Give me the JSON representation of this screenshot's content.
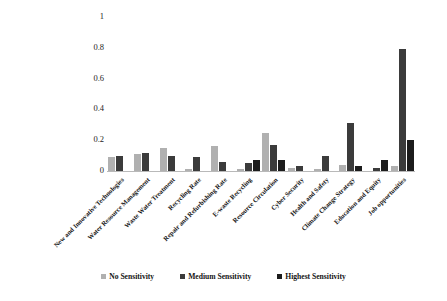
{
  "chart_data": {
    "type": "bar",
    "title": "",
    "xlabel": "",
    "ylabel": "",
    "ylim": [
      0,
      1
    ],
    "yticks": [
      "0",
      "0.2",
      "0.4",
      "0.6",
      "0.8",
      "1"
    ],
    "grid": false,
    "legend_position": "bottom",
    "categories": [
      "New and Innovative Technologies",
      "Water Resource Management",
      "Waste Water Treatment",
      "Recycling Rate",
      "Repair and Refurbishing Rate",
      "E-waste Recycling",
      "Resource Circulation",
      "Cyber Security",
      "Health and Safety",
      "Climate Change Strategy",
      "Education and Equity",
      "Job opportunities"
    ],
    "series": [
      {
        "name": "No Sensitivity",
        "color": "#b0b0b0",
        "values": [
          0.09,
          0.11,
          0.15,
          0.01,
          0.16,
          0.01,
          0.25,
          0.02,
          0.01,
          0.04,
          0.0,
          0.03
        ]
      },
      {
        "name": "Medium Sensitivity",
        "color": "#3b3b3b",
        "values": [
          0.1,
          0.12,
          0.1,
          0.09,
          0.06,
          0.05,
          0.17,
          0.03,
          0.1,
          0.31,
          0.02,
          0.79
        ]
      },
      {
        "name": "Highest Sensitivity",
        "color": "#1c1c1c",
        "values": [
          0.0,
          0.0,
          0.0,
          0.0,
          0.0,
          0.07,
          0.07,
          0.0,
          0.0,
          0.03,
          0.07,
          0.2
        ]
      }
    ]
  },
  "legend": {
    "items": [
      {
        "label": "No Sensitivity"
      },
      {
        "label": "Medium Sensitivity"
      },
      {
        "label": "Highest Sensitivity"
      }
    ]
  }
}
